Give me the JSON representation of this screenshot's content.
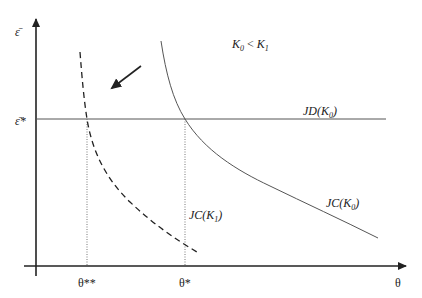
{
  "diagram": {
    "axes": {
      "y_label": "ε̄",
      "x_label": "θ"
    },
    "level_labels": {
      "eps_star": "ε̄*"
    },
    "x_markers": {
      "theta_double_star": "θ**",
      "theta_star": "θ*"
    },
    "condition": {
      "k0": "K",
      "k0_sub": "0",
      "lt": " < ",
      "k1": "K",
      "k1_sub": "1"
    },
    "curves": {
      "jd_k0": {
        "prefix": "JD(K",
        "sub": "0",
        "suffix": ")",
        "style": "solid horizontal"
      },
      "jc_k0": {
        "prefix": "JC(K",
        "sub": "0",
        "suffix": ")",
        "style": "solid decreasing"
      },
      "jc_k1": {
        "prefix": "JC(K",
        "sub": "1",
        "suffix": ")",
        "style": "dashed decreasing"
      }
    },
    "shift_arrow": "down-left",
    "colors": {
      "axis": "#222222",
      "curve": "#555555",
      "guide": "#777777"
    }
  }
}
